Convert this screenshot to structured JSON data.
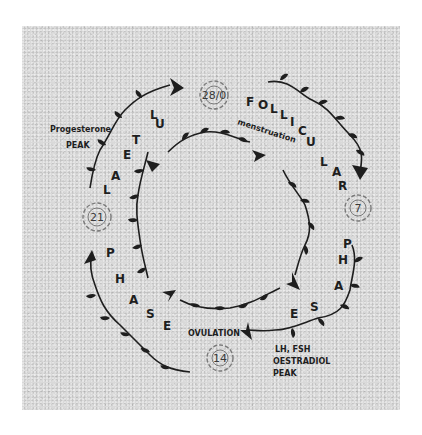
{
  "diagram": {
    "phases": {
      "follicular": {
        "label": "FOLLICULAR PHASE",
        "letters": [
          "F",
          "O",
          "L",
          "L",
          "I",
          "C",
          "U",
          "L",
          "A",
          "R",
          "P",
          "H",
          "A",
          "S",
          "E"
        ]
      },
      "luteal": {
        "label": "LUTEAL PHASE",
        "letters": [
          "L",
          "U",
          "T",
          "E",
          "A",
          "L",
          "P",
          "H",
          "A",
          "S",
          "E"
        ]
      }
    },
    "days": [
      {
        "id": "day0",
        "label": "28/0"
      },
      {
        "id": "day7",
        "label": "7"
      },
      {
        "id": "day14",
        "label": "14"
      },
      {
        "id": "day21",
        "label": "21"
      }
    ],
    "annotations": {
      "menstruation": "menstruation",
      "ovulation": "OVULATION",
      "lh_fsh_line1": "LH, FSH",
      "lh_fsh_line2": "OESTRADIOL",
      "lh_fsh_line3": "PEAK",
      "progesterone_line1": "Progesterone",
      "progesterone_line2": "PEAK"
    },
    "colors": {
      "ink": "#1e1e1e",
      "flower": "#7a7a7a",
      "paper": "#d9d9d9"
    }
  }
}
